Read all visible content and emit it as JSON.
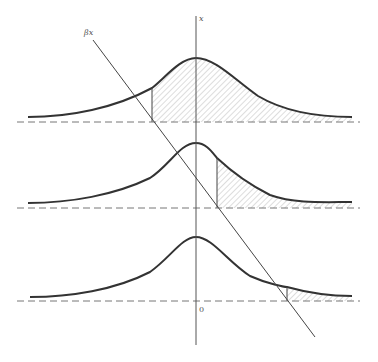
{
  "figure": {
    "labels": {
      "axis_label": "x",
      "line_label": "βx",
      "origin_label": "0"
    },
    "colors": {
      "curve": "#333333",
      "axis": "#555555",
      "dashed": "#777777",
      "hatch": "#aaaaaa"
    },
    "panels": [
      {
        "name": "top",
        "peak_y": 58,
        "baseline_y": 122,
        "cutoff_x": 152,
        "shaded": "right-of-cutoff"
      },
      {
        "name": "middle",
        "peak_y": 143,
        "baseline_y": 208,
        "cutoff_x": 217,
        "shaded": "right-of-cutoff"
      },
      {
        "name": "bottom",
        "peak_y": 237,
        "baseline_y": 301,
        "cutoff_x": 287,
        "shaded": "right-of-cutoff"
      }
    ],
    "axis": {
      "x": 196,
      "top_y": 16,
      "bottom_y": 345
    },
    "diagonal_line": {
      "x1": 93,
      "y1": 40,
      "x2": 315,
      "y2": 337
    }
  }
}
